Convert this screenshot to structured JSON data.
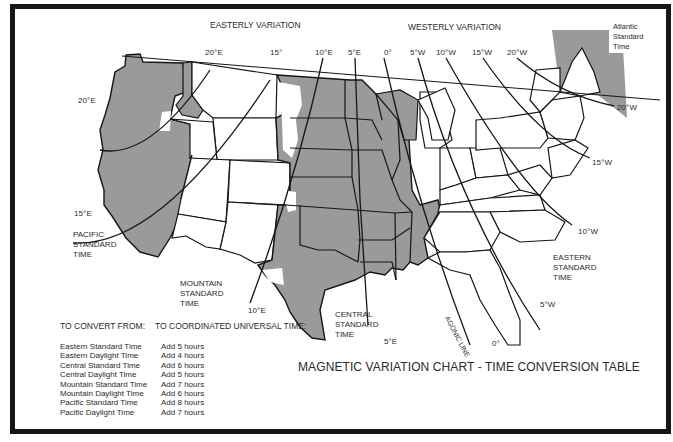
{
  "headers": {
    "easterly": "EASTERLY VARIATION",
    "westerly": "WESTERLY VARIATION"
  },
  "isogonic_labels": {
    "e20_top": "20°E",
    "e20_left": "20°E",
    "e15_top": "15°",
    "e15_left": "15°E",
    "e10_top": "10°E",
    "e10_bottom": "10°E",
    "e5_top": "5°E",
    "e5_bottom": "5°E",
    "zero_top": "0°",
    "zero_bottom": "0°",
    "w5_top": "5°W",
    "w5_bottom": "5°W",
    "w10_top": "10°W",
    "w10_right": "10°W",
    "w15_top": "15°W",
    "w15_right": "15°W",
    "w20_top": "20°W",
    "w20_right": "20°W"
  },
  "agonic_line_label": "AGONIC LINE",
  "time_zones": {
    "pacific": [
      "PACIFIC",
      "STANDARD",
      "TIME"
    ],
    "mountain": [
      "MOUNTAIN",
      "STANDARD",
      "TIME"
    ],
    "central": [
      "CENTRAL",
      "STANDARD",
      "TIME"
    ],
    "eastern": [
      "EASTERN",
      "STANDARD",
      "TIME"
    ],
    "atlantic": [
      "Atlantic",
      "Standard",
      "Time"
    ]
  },
  "colors": {
    "central_shade": "#9a9a9a",
    "border": "#161616",
    "text": "#2a2a2a"
  },
  "conversion_table": {
    "from_header": "TO CONVERT FROM:",
    "to_header": "TO COORDINATED UNIVERSAL TIME:",
    "rows": [
      {
        "from": "Eastern Standard Time",
        "to": "Add 5 hours"
      },
      {
        "from": "Eastern Daylight Time",
        "to": "Add 4 hours"
      },
      {
        "from": "Central Standard Time",
        "to": "Add 6 hours"
      },
      {
        "from": "Central Daylight Time",
        "to": "Add 5 hours"
      },
      {
        "from": "Mountain Standard Time",
        "to": "Add 7 hours"
      },
      {
        "from": "Mountain Daylight Time",
        "to": "Add 6 hours"
      },
      {
        "from": "Pacific Standard Time",
        "to": "Add 8 hours"
      },
      {
        "from": "Pacific Daylight Time",
        "to": "Add 7 hours"
      }
    ]
  },
  "title": "MAGNETIC VARIATION CHART - TIME CONVERSION TABLE"
}
